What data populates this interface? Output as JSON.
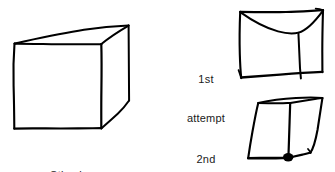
{
  "figure": {
    "background_color": "#ffffff",
    "ink_color": "#000000",
    "text_color": "#1a1a1a",
    "width": 335,
    "height": 172
  },
  "labels": {
    "stimulus": "Stimulus",
    "attempt1_line1": "1st",
    "attempt1_line2": "attempt",
    "attempt2_line1": "2nd",
    "attempt2_line2": "attempt"
  },
  "drawings": {
    "stimulus": {
      "name": "stimulus-cube",
      "stroke_width": 2.0,
      "strokes": [
        "M14,44 L13.5,86 L14,128",
        "M14,128 L56,128.5 L101,128",
        "M101,128 L101.5,86 L101,44",
        "M101,44 L58,44.5 L14,44",
        "M14,44 L72,30 L128,26",
        "M101,44 L128,26",
        "M128,26 L128.5,62 L129,100",
        "M101,128 L115,114 L129,100"
      ]
    },
    "attempt1": {
      "name": "attempt1-cube",
      "stroke_width": 2.0,
      "strokes": [
        "M240,12 L240,45 L241,77",
        "M241,77 L282,75 L322,72",
        "M322,72 L322.5,41 L323,10",
        "M323,10 L283,12 L240,12",
        "M240,12 L268,27 L297,33 L313,25 L323,10",
        "M297,33 L299,55 L301,77"
      ]
    },
    "attempt2": {
      "name": "attempt2-cube",
      "stroke_width": 2.0,
      "strokes": [
        "M258,103 L253,130 L248,158",
        "M248,158 L268,158 L288,158",
        "M288,158 L289,130 L290,103",
        "M290,103 L274,103 L258,103",
        "M258,103 L290,97 L322,98",
        "M290,103 L322,98",
        "M322,98 L316,125 L310,152",
        "M288,158 L299,155 L310,152"
      ],
      "blob": {
        "cx": 288,
        "cy": 157,
        "rx": 5.5,
        "ry": 4.5
      }
    }
  }
}
